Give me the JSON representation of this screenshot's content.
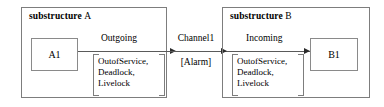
{
  "diagram": {
    "type": "component-communication-diagram",
    "substructures": [
      {
        "id": "A",
        "keyword": "substructure",
        "name": "A",
        "component": {
          "label": "A1"
        },
        "port": {
          "label": "Outgoing",
          "constraints": [
            "OutofService,",
            "Deadlock,",
            "Livelock"
          ]
        }
      },
      {
        "id": "B",
        "keyword": "substructure",
        "name": "B",
        "component": {
          "label": "B1"
        },
        "port": {
          "label": "Incoming",
          "constraints": [
            "OutofService,",
            "Deadlock,",
            "Livelock"
          ]
        }
      }
    ],
    "channel": {
      "name": "Channel1",
      "annotation": "[Alarm]"
    },
    "colors": {
      "stroke": "#7d7d7d",
      "line": "#5a5a5a",
      "arrow": "#2c2c2c",
      "text": "#000000",
      "background": "#ffffff"
    }
  }
}
